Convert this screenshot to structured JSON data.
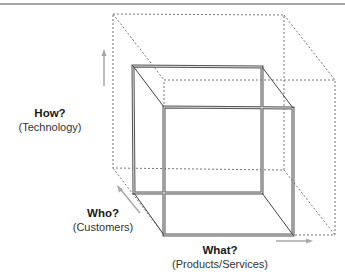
{
  "diagram": {
    "type": "3d-cube-dimensions",
    "axes": [
      {
        "id": "how",
        "question": "How?",
        "label": "(Technology)",
        "direction": "vertical"
      },
      {
        "id": "who",
        "question": "Who?",
        "label": "(Customers)",
        "direction": "depth"
      },
      {
        "id": "what",
        "question": "What?",
        "label": "(Products/Services)",
        "direction": "horizontal"
      }
    ],
    "shapes": [
      {
        "id": "current-scope-cube",
        "style": "solid-double-line"
      },
      {
        "id": "expanded-scope-cube",
        "style": "dotted"
      }
    ],
    "colors": {
      "solid_line": "#555555",
      "solid_line_inner": "#bdbdbd",
      "dotted_line": "#777777",
      "arrow": "#a8a8a8",
      "top_rule": "#8a8a8a"
    }
  }
}
